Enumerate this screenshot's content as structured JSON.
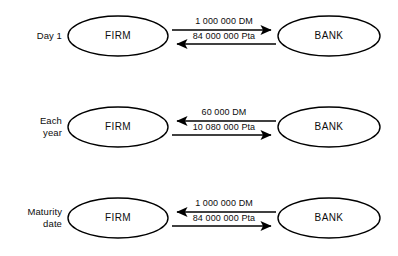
{
  "diagram": {
    "node_left_label": "FIRM",
    "node_right_label": "BANK",
    "stroke_color": "#000000",
    "background_color": "#ffffff",
    "rows": [
      {
        "stage_label_line1": "Day 1",
        "stage_label_line2": "",
        "left_node": "FIRM",
        "right_node": "BANK",
        "flows": [
          {
            "label": "1 000 000 DM",
            "direction": "right"
          },
          {
            "label": "84 000 000 Pta",
            "direction": "left"
          }
        ]
      },
      {
        "stage_label_line1": "Each",
        "stage_label_line2": "year",
        "left_node": "FIRM",
        "right_node": "BANK",
        "flows": [
          {
            "label": "60 000 DM",
            "direction": "left"
          },
          {
            "label": "10 080 000 Pta",
            "direction": "right"
          }
        ]
      },
      {
        "stage_label_line1": "Maturity",
        "stage_label_line2": "date",
        "left_node": "FIRM",
        "right_node": "BANK",
        "flows": [
          {
            "label": "1 000 000 DM",
            "direction": "left"
          },
          {
            "label": "84 000 000 Pta",
            "direction": "right"
          }
        ]
      }
    ]
  }
}
